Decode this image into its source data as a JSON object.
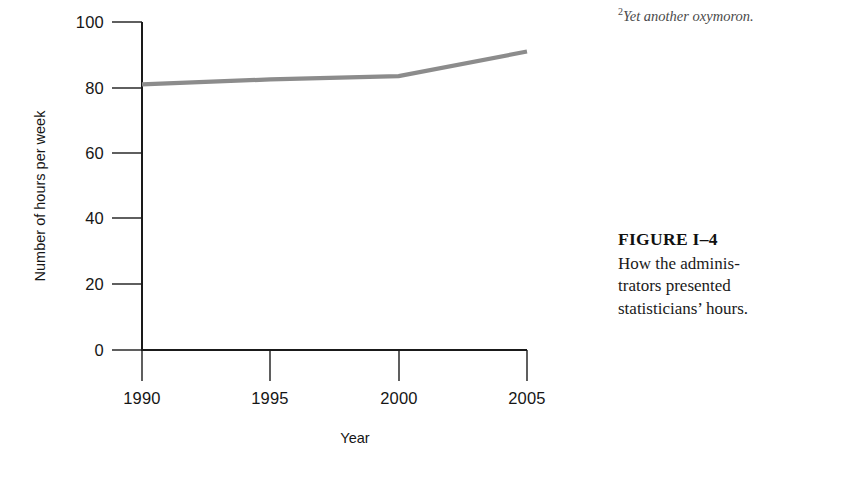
{
  "figure": {
    "number_label": "FIGURE I–4",
    "caption_lines": [
      "How the adminis-",
      "trators presented",
      "statisticians’ hours."
    ]
  },
  "footnote": {
    "marker": "2",
    "text": "Yet another oxymoron."
  },
  "chart_data": {
    "type": "line",
    "title": "",
    "xlabel": "Year",
    "ylabel": "Number of hours per week",
    "x": [
      1990,
      1995,
      2000,
      2005
    ],
    "values": [
      81,
      82.5,
      83.5,
      91
    ],
    "series": [
      {
        "name": "Hours per week",
        "values": [
          81,
          82.5,
          83.5,
          91
        ],
        "color": "#8c8c8c"
      }
    ],
    "xlim": [
      1990,
      2005
    ],
    "ylim": [
      0,
      100
    ],
    "ytick_labels": [
      "100",
      "80",
      "60",
      "40",
      "20",
      "0"
    ],
    "ytick_values": [
      100,
      80,
      60,
      40,
      20,
      0
    ],
    "xtick_labels": [
      "1990",
      "1995",
      "2000",
      "2005"
    ],
    "xtick_values": [
      1990,
      1995,
      2000,
      2005
    ],
    "grid": false,
    "legend": "none",
    "line_color": "#8c8c8c",
    "axis_color": "#1a1a1a"
  }
}
